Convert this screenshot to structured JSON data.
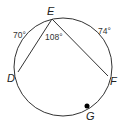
{
  "diagram": {
    "type": "circle-inscribed-angle",
    "points": {
      "E": {
        "label": "E"
      },
      "D": {
        "label": "D"
      },
      "F": {
        "label": "F"
      },
      "G": {
        "label": "G"
      }
    },
    "arcs": {
      "DE": "70°",
      "EF": "74°"
    },
    "angle_DEF": "108°",
    "colors": {
      "stroke": "#333333",
      "point": "#000000"
    }
  }
}
